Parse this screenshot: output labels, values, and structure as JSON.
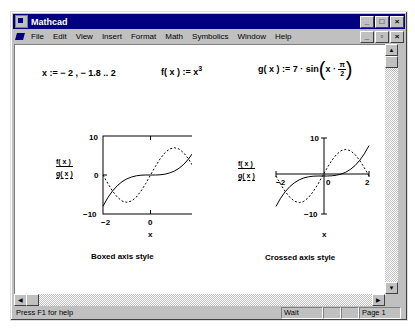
{
  "window": {
    "title": "Mathcad",
    "controls": [
      "_",
      "□",
      "×"
    ],
    "doc_controls": [
      "_",
      "▫",
      "×"
    ]
  },
  "menu": {
    "items": [
      {
        "label": "File",
        "key": "F"
      },
      {
        "label": "Edit",
        "key": "E"
      },
      {
        "label": "View",
        "key": "V"
      },
      {
        "label": "Insert",
        "key": "I"
      },
      {
        "label": "Format",
        "key": "o"
      },
      {
        "label": "Math",
        "key": "M"
      },
      {
        "label": "Symbolics",
        "key": "S"
      },
      {
        "label": "Window",
        "key": "W"
      },
      {
        "label": "Help",
        "key": "H"
      }
    ]
  },
  "worksheet": {
    "range_def": "x  :=  − 2 , − 1.8 .. 2",
    "f_def_lhs": "f( x )  :=  x",
    "f_def_exp": "3",
    "g_def_lhs": "g( x )  :=  7 · sin",
    "g_def_x": "x ·",
    "g_frac_num": "π",
    "g_frac_den": "2",
    "legend_f": "f( x )",
    "legend_g": "g( x )",
    "caption_boxed": "Boxed axis style",
    "caption_crossed": "Crossed axis style"
  },
  "chart_data": [
    {
      "type": "line",
      "title": "Boxed axis style",
      "xlabel": "x",
      "ylabel": "f(x), g(x)",
      "xlim": [
        -2,
        2
      ],
      "ylim": [
        -10,
        10
      ],
      "x_ticks": [
        "-2",
        "0",
        "2"
      ],
      "y_ticks": [
        "10",
        "0",
        "-10"
      ],
      "axis_style": "boxed",
      "series": [
        {
          "name": "f(x) = x^3",
          "style": "solid",
          "x": [
            -2,
            -1.8,
            -1.6,
            -1.4,
            -1.2,
            -1,
            -0.8,
            -0.6,
            -0.4,
            -0.2,
            0,
            0.2,
            0.4,
            0.6,
            0.8,
            1,
            1.2,
            1.4,
            1.6,
            1.8,
            2
          ],
          "values": [
            -8,
            -5.832,
            -4.096,
            -2.744,
            -1.728,
            -1,
            -0.512,
            -0.216,
            -0.064,
            -0.008,
            0,
            0.008,
            0.064,
            0.216,
            0.512,
            1,
            1.728,
            2.744,
            4.096,
            5.832,
            8
          ]
        },
        {
          "name": "g(x) = 7·sin(x·π/2)",
          "style": "dashed",
          "x": [
            -2,
            -1.8,
            -1.6,
            -1.4,
            -1.2,
            -1,
            -0.8,
            -0.6,
            -0.4,
            -0.2,
            0,
            0.2,
            0.4,
            0.6,
            0.8,
            1,
            1.2,
            1.4,
            1.6,
            1.8,
            2
          ],
          "values": [
            0,
            -2.163,
            -4.114,
            -5.663,
            -6.657,
            -7,
            -6.657,
            -5.663,
            -4.114,
            -2.163,
            0,
            2.163,
            4.114,
            5.663,
            6.657,
            7,
            6.657,
            5.663,
            4.114,
            2.163,
            0
          ]
        }
      ]
    },
    {
      "type": "line",
      "title": "Crossed axis style",
      "xlabel": "x",
      "ylabel": "f(x), g(x)",
      "xlim": [
        -2,
        2
      ],
      "ylim": [
        -10,
        10
      ],
      "x_ticks": [
        "-2",
        "0",
        "2"
      ],
      "y_ticks": [
        "10",
        "-10"
      ],
      "axis_style": "crossed",
      "series": [
        {
          "name": "f(x) = x^3",
          "style": "solid",
          "x": [
            -2,
            -1.8,
            -1.6,
            -1.4,
            -1.2,
            -1,
            -0.8,
            -0.6,
            -0.4,
            -0.2,
            0,
            0.2,
            0.4,
            0.6,
            0.8,
            1,
            1.2,
            1.4,
            1.6,
            1.8,
            2
          ],
          "values": [
            -8,
            -5.832,
            -4.096,
            -2.744,
            -1.728,
            -1,
            -0.512,
            -0.216,
            -0.064,
            -0.008,
            0,
            0.008,
            0.064,
            0.216,
            0.512,
            1,
            1.728,
            2.744,
            4.096,
            5.832,
            8
          ]
        },
        {
          "name": "g(x) = 7·sin(x·π/2)",
          "style": "dashed",
          "x": [
            -2,
            -1.8,
            -1.6,
            -1.4,
            -1.2,
            -1,
            -0.8,
            -0.6,
            -0.4,
            -0.2,
            0,
            0.2,
            0.4,
            0.6,
            0.8,
            1,
            1.2,
            1.4,
            1.6,
            1.8,
            2
          ],
          "values": [
            0,
            -2.163,
            -4.114,
            -5.663,
            -6.657,
            -7,
            -6.657,
            -5.663,
            -4.114,
            -2.163,
            0,
            2.163,
            4.114,
            5.663,
            6.657,
            7,
            6.657,
            5.663,
            4.114,
            2.163,
            0
          ]
        }
      ]
    }
  ],
  "plot_labels": {
    "boxed": {
      "y_top": "10",
      "y_mid": "0",
      "y_bot": "−10",
      "x_left": "−2",
      "x_mid": "0",
      "x_right": "2",
      "xlabel": "x"
    },
    "crossed": {
      "y_top": "10",
      "y_bot": "−10",
      "x_left": "−2",
      "x_mid": "0",
      "x_right": "2",
      "xlabel": "x"
    }
  },
  "status": {
    "help": "Press F1 for help",
    "mode": "Wait",
    "cell2": "",
    "cell3": "",
    "page": "Page 1"
  }
}
